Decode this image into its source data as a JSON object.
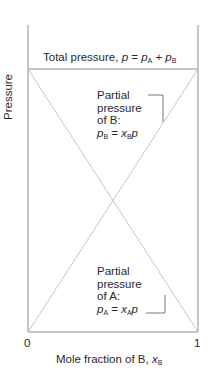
{
  "diagram": {
    "type": "ideal-solution-partial-pressure",
    "y_axis_label": "Pressure",
    "x_axis_label_prefix": "Mole fraction of B, ",
    "x_axis_var": "x",
    "x_axis_sub": "B",
    "x_ticks": [
      "0",
      "1"
    ],
    "total_pressure": {
      "prefix": "Total pressure, ",
      "p": "p",
      "eq": " = ",
      "pa": "p",
      "pa_sub": "A",
      "plus": " + ",
      "pb": "p",
      "pb_sub": "B"
    },
    "partial_b": {
      "line1": "Partial",
      "line2": "pressure",
      "line3": "of B:",
      "eq_lhs": "p",
      "eq_lhs_sub": "B",
      "eq_mid": " = ",
      "eq_x": "x",
      "eq_x_sub": "B",
      "eq_p": "p"
    },
    "partial_a": {
      "line1": "Partial",
      "line2": "pressure",
      "line3": "of A:",
      "eq_lhs": "p",
      "eq_lhs_sub": "A",
      "eq_mid": " = ",
      "eq_x": "x",
      "eq_x_sub": "A",
      "eq_p": "p"
    },
    "colors": {
      "axis": "#8a8a8a",
      "lines": "#c8c8c8",
      "text": "#2a2a2a"
    }
  }
}
